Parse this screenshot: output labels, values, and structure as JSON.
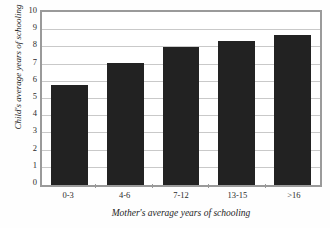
{
  "chart_data": {
    "type": "bar",
    "title": "",
    "categories": [
      "0-3",
      "4-6",
      "7-12",
      "13-15",
      ">16"
    ],
    "values": [
      5.8,
      7.1,
      8.05,
      8.35,
      8.7
    ],
    "series": [
      {
        "name": "Child's average years of schooling",
        "values": [
          5.8,
          7.1,
          8.05,
          8.35,
          8.7
        ]
      }
    ],
    "xlabel": "Mother's average years of schooling",
    "ylabel": "Child's average years of schooling",
    "ylim": [
      0,
      10
    ],
    "ytick_labels": [
      "0",
      "1",
      "2",
      "3",
      "4",
      "5",
      "6",
      "7",
      "8",
      "9",
      "10"
    ],
    "ytick_values": [
      0,
      1,
      2,
      3,
      4,
      5,
      6,
      7,
      8,
      9,
      10
    ],
    "grid": "horizontal",
    "legend": "none",
    "bar_color": "#222222",
    "frame_color": "#9a9a9a",
    "gridline_color": "#c9c9c9",
    "background_color": "#ffffff"
  }
}
